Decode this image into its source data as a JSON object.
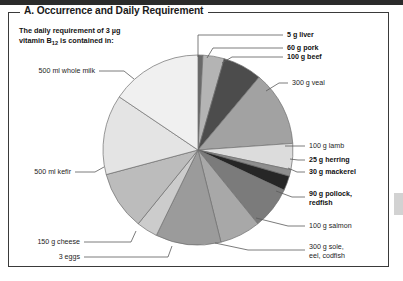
{
  "panel": {
    "title": "A. Occurrence and Daily Requirement",
    "intro_line1": "The daily requirement of 3 µg",
    "intro_line2_pre": "vitamin B",
    "intro_line2_sub": "12",
    "intro_line2_post": " is contained in:"
  },
  "colors": {
    "frame": "#3a3a3a",
    "topbar": "#2b2b2b",
    "leader": "#5a5a5a",
    "outline": "#6e6e6e",
    "side_tab": "#d2d2d2"
  },
  "chart_data": {
    "type": "pie",
    "title": "A. Occurrence and Daily Requirement",
    "subtitle": "The daily requirement of 3 µg vitamin B12 is contained in:",
    "units": "degrees of circle (equal-share wedges sized by drawing)",
    "start_angle_deg": -90,
    "direction": "clockwise",
    "legend": "labels with leader lines around the pie",
    "grid": false,
    "categories": [
      "5 g liver",
      "60 g pork",
      "100 g beef",
      "300 g veal",
      "100 g lamb",
      "25 g herring",
      "30 g mackerel",
      "90 g pollock, redfish",
      "100 g salmon",
      "300 g sole, eel, codfish",
      "3 eggs",
      "150 g cheese",
      "500 ml kefir",
      "500 ml whole milk"
    ],
    "values": [
      3,
      13,
      24,
      46,
      16,
      4,
      9,
      26,
      25,
      40,
      13,
      36,
      49,
      56
    ],
    "slices": [
      {
        "label": "5 g liver",
        "bold": true,
        "angle": 3,
        "color": "#6a6a6a"
      },
      {
        "label": "60 g pork",
        "bold": true,
        "angle": 13,
        "color": "#b4b4b4"
      },
      {
        "label": "100 g beef",
        "bold": true,
        "angle": 24,
        "color": "#4c4c4c"
      },
      {
        "label": "300 g veal",
        "bold": false,
        "angle": 46,
        "color": "#a2a2a2"
      },
      {
        "label": "100 g lamb",
        "bold": false,
        "angle": 16,
        "color": "#dcdcdc"
      },
      {
        "label": "25 g herring",
        "bold": true,
        "angle": 4,
        "color": "#8e8e8e"
      },
      {
        "label": "30 g mackerel",
        "bold": true,
        "angle": 9,
        "color": "#262626"
      },
      {
        "label": "90 g pollock, redfish",
        "bold": true,
        "angle": 26,
        "color": "#7b7b7b"
      },
      {
        "label": "100 g salmon",
        "bold": false,
        "angle": 25,
        "color": "#a8a8a8"
      },
      {
        "label": "300 g sole, eel, codfish",
        "bold": false,
        "angle": 40,
        "color": "#9b9b9b"
      },
      {
        "label": "3 eggs",
        "bold": false,
        "angle": 13,
        "color": "#cccccc"
      },
      {
        "label": "150 g cheese",
        "bold": false,
        "angle": 36,
        "color": "#bcbcbc"
      },
      {
        "label": "500 ml kefir",
        "bold": false,
        "angle": 49,
        "color": "#e4e4e4"
      },
      {
        "label": "500 ml whole milk",
        "bold": false,
        "angle": 56,
        "color": "#f0f0f0"
      }
    ]
  },
  "labels": {
    "liver": "5 g liver",
    "pork": "60 g pork",
    "beef": "100 g beef",
    "veal": "300 g veal",
    "lamb": "100 g lamb",
    "herring": "25 g herring",
    "mackerel": "30 g mackerel",
    "pollock_l1": "90 g pollock,",
    "pollock_l2": "redfish",
    "salmon": "100 g salmon",
    "sole_l1": "300 g sole,",
    "sole_l2": "eel, codfish",
    "eggs": "3 eggs",
    "cheese": "150 g cheese",
    "kefir": "500 ml kefir",
    "milk": "500 ml whole milk"
  }
}
